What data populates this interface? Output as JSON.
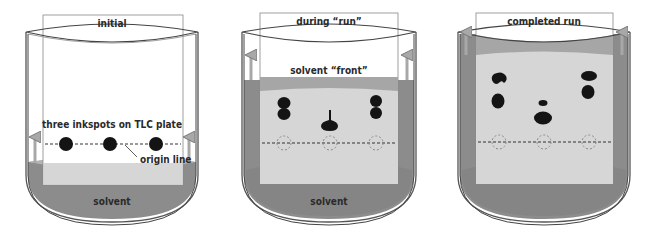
{
  "colors": {
    "solvent": "#8c8c8c",
    "solvent_light": "#b4b4b4",
    "plate_wet": "#d6d6d6",
    "plate_dry": "#ffffff",
    "front_band": "#a6a6a6",
    "ink": "#141414",
    "outline": "#555555",
    "arrow": "#a8a8a8",
    "origin_circle": "#8a8a8a"
  },
  "panels": [
    {
      "id": "initial",
      "title": "initial",
      "solvent_label": "solvent",
      "annotations": {
        "inkspots": "three inkspots on TLC plate",
        "origin": "origin line"
      },
      "solvent_front_fraction": 0.0,
      "lanes": [
        {
          "spots": [
            {
              "type": "round",
              "rf": 0.0
            }
          ]
        },
        {
          "spots": [
            {
              "type": "round",
              "rf": 0.0
            }
          ]
        },
        {
          "spots": [
            {
              "type": "round",
              "rf": 0.0
            }
          ]
        }
      ]
    },
    {
      "id": "during-run",
      "title": "during “run”",
      "solvent_label": "solvent",
      "annotations": {
        "front": "solvent “front”"
      },
      "solvent_front_fraction": 0.62,
      "lanes": [
        {
          "spots": [
            {
              "type": "double",
              "rf": 0.55
            }
          ]
        },
        {
          "spots": [
            {
              "type": "teardrop",
              "rf": 0.33
            }
          ]
        },
        {
          "spots": [
            {
              "type": "double",
              "rf": 0.55
            }
          ]
        }
      ]
    },
    {
      "id": "completed-run",
      "title": "completed run",
      "solvent_label": "",
      "annotations": {},
      "solvent_front_fraction": 0.95,
      "lanes": [
        {
          "spots": [
            {
              "type": "blob",
              "rf": 0.7
            },
            {
              "type": "blob",
              "rf": 0.45
            }
          ]
        },
        {
          "spots": [
            {
              "type": "small",
              "rf": 0.42
            },
            {
              "type": "oval",
              "rf": 0.25
            }
          ]
        },
        {
          "spots": [
            {
              "type": "flat",
              "rf": 0.74
            },
            {
              "type": "blob",
              "rf": 0.55
            }
          ]
        }
      ]
    }
  ]
}
